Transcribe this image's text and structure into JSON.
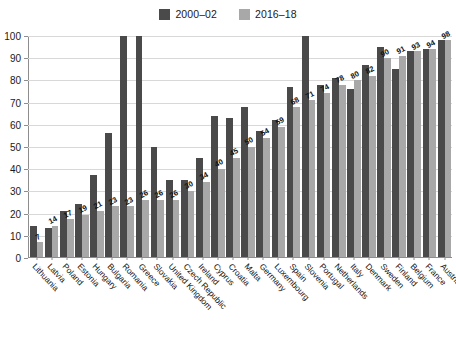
{
  "chart_data": {
    "type": "bar",
    "title": "",
    "subtitle": "",
    "xlabel": "",
    "ylabel": "",
    "ylim": [
      0,
      100
    ],
    "yticks": [
      0,
      10,
      20,
      30,
      40,
      50,
      60,
      70,
      80,
      90,
      100
    ],
    "grid": true,
    "legend_position": "top-center",
    "categories": [
      "Lithuania",
      "Latvia",
      "Poland",
      "Estonia",
      "Hungary",
      "Bulgaria",
      "Romania",
      "Greece",
      "Slovakia",
      "United Kingdom",
      "Czech Republic",
      "Ireland",
      "Cyprus",
      "Croatia",
      "Malta",
      "Germany",
      "Luxembourg",
      "Spain",
      "Slovenia",
      "Portugal",
      "Netherlands",
      "Italy",
      "Denmark",
      "Sweden",
      "Finland",
      "Belgium",
      "France",
      "Austria"
    ],
    "series": [
      {
        "name": "2000–02",
        "color": "#4a4a4a",
        "values": [
          14,
          13,
          21,
          24,
          37,
          56,
          100,
          100,
          50,
          35,
          35,
          45,
          64,
          63,
          68,
          57,
          62,
          77,
          100,
          78,
          81,
          76,
          87,
          95,
          85,
          93,
          94,
          98
        ],
        "labels": [
          "",
          "",
          "",
          "",
          "",
          "",
          "",
          "",
          "",
          "",
          "",
          "",
          "",
          "",
          "",
          "",
          "",
          "",
          "",
          "",
          "",
          "",
          "",
          "",
          "",
          "",
          "",
          ""
        ]
      },
      {
        "name": "2016–18",
        "color": "#a8a8a8",
        "values": [
          7,
          14,
          17,
          19,
          21,
          23,
          23,
          26,
          26,
          26,
          30,
          34,
          40,
          45,
          50,
          54,
          59,
          68,
          71,
          74,
          78,
          80,
          82,
          90,
          91,
          93,
          94,
          98
        ],
        "labels": [
          "7",
          "14",
          "17",
          "19",
          "21",
          "23",
          "23",
          "26",
          "26",
          "26",
          "30",
          "34",
          "40",
          "45",
          "50",
          "54",
          "59",
          "68",
          "71",
          "74",
          "78",
          "80",
          "82",
          "90",
          "91",
          "93",
          "94",
          "98"
        ]
      }
    ]
  },
  "legend": {
    "items": [
      {
        "label": "2000–02",
        "color": "#4a4a4a",
        "swatch_name": "legend-swatch-2000-02"
      },
      {
        "label": "2016–18",
        "color": "#a8a8a8",
        "swatch_name": "legend-swatch-2016-18"
      }
    ]
  }
}
